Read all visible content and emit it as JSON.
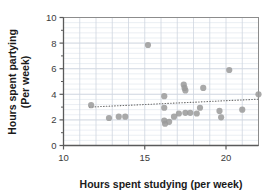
{
  "chart_data": {
    "type": "scatter",
    "title": "",
    "xlabel": "Hours spent studying (per week)",
    "ylabel_line1": "Hours spent partying",
    "ylabel_line2": "(Per week)",
    "xlim": [
      10,
      22
    ],
    "ylim": [
      0,
      10
    ],
    "xticks": [
      10,
      15,
      20
    ],
    "yticks": [
      0,
      2,
      4,
      6,
      8,
      10
    ],
    "xtick_labels": [
      "10",
      "15",
      "20"
    ],
    "ytick_labels": [
      "0",
      "2",
      "4",
      "6",
      "8",
      "10"
    ],
    "grid": true,
    "grid_minor_y_step": 0.4,
    "grid_major_x_step": 1,
    "legend": "none",
    "marker_color": "#9a9a9a",
    "marker_radius": 3.1,
    "trendline": {
      "style": "dotted",
      "color": "#6e6e6e",
      "x_start": 11.6,
      "y_start": 3.0,
      "x_end": 22.0,
      "y_end": 3.62
    },
    "points": [
      {
        "x": 11.7,
        "y": 3.15
      },
      {
        "x": 12.8,
        "y": 2.15
      },
      {
        "x": 13.4,
        "y": 2.25
      },
      {
        "x": 13.8,
        "y": 2.25
      },
      {
        "x": 15.2,
        "y": 7.85
      },
      {
        "x": 16.2,
        "y": 3.85
      },
      {
        "x": 16.2,
        "y": 2.95
      },
      {
        "x": 16.2,
        "y": 1.95
      },
      {
        "x": 16.25,
        "y": 1.7
      },
      {
        "x": 16.5,
        "y": 1.85
      },
      {
        "x": 16.8,
        "y": 2.25
      },
      {
        "x": 17.1,
        "y": 2.5
      },
      {
        "x": 17.4,
        "y": 4.75
      },
      {
        "x": 17.45,
        "y": 4.5
      },
      {
        "x": 17.5,
        "y": 4.3
      },
      {
        "x": 17.5,
        "y": 2.55
      },
      {
        "x": 17.8,
        "y": 2.55
      },
      {
        "x": 18.2,
        "y": 2.5
      },
      {
        "x": 18.4,
        "y": 2.95
      },
      {
        "x": 18.6,
        "y": 4.5
      },
      {
        "x": 19.6,
        "y": 2.7
      },
      {
        "x": 19.7,
        "y": 2.2
      },
      {
        "x": 20.2,
        "y": 5.9
      },
      {
        "x": 21.0,
        "y": 2.8
      },
      {
        "x": 22.0,
        "y": 4.0
      }
    ]
  },
  "colors": {
    "axis": "#5a5a5a",
    "grid_major": "#cfd6e0",
    "grid_minor": "#e3e8ef",
    "marker": "#9a9a9a",
    "trend": "#6e6e6e",
    "text": "#1a1a1a"
  }
}
